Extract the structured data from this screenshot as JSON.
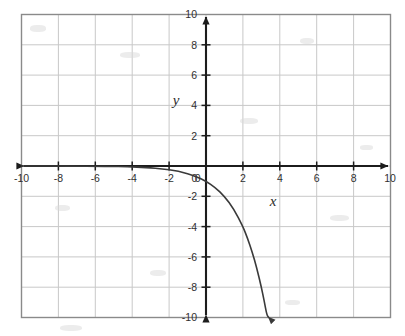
{
  "figure": {
    "name": "coordinate-grid-graph",
    "background_color": "#ffffff",
    "grid_color": "#c8c8c8",
    "border_color": "#8a8a8a",
    "axis_color": "#1c1c1c",
    "curve_color": "#3a3a3a"
  },
  "labels": {
    "x_axis_name": "x",
    "y_axis_name": "y"
  },
  "chart_data": {
    "type": "line",
    "title": "",
    "xlabel": "x",
    "ylabel": "y",
    "xlim": [
      -10,
      10
    ],
    "ylim": [
      -10,
      10
    ],
    "grid": true,
    "grid_step": 2,
    "legend": "none",
    "x_ticks": [
      -10,
      -8,
      -6,
      -4,
      -2,
      0,
      2,
      4,
      6,
      8,
      10
    ],
    "x_tick_labels": [
      "-10",
      "-8",
      "-6",
      "-4",
      "-2",
      "0",
      "2",
      "4",
      "6",
      "8",
      "10"
    ],
    "y_ticks": [
      10,
      8,
      6,
      4,
      2,
      0,
      -2,
      -4,
      -6,
      -8,
      -10
    ],
    "y_tick_labels": [
      "10",
      "8",
      "6",
      "4",
      "2",
      "0",
      "-2",
      "-4",
      "-6",
      "-8",
      "-10"
    ],
    "series": [
      {
        "name": "negative exponential curve",
        "equation": "y = -2^x",
        "arrow_end": "down-right",
        "asymptote": "y = 0",
        "x": [
          -10,
          -9,
          -8,
          -7,
          -6,
          -5,
          -4.5,
          -4,
          -3.5,
          -3,
          -2.5,
          -2,
          -1.5,
          -1,
          -0.5,
          0,
          0.5,
          1,
          1.5,
          2,
          2.25,
          2.5,
          2.75,
          3,
          3.15,
          3.3,
          3.4
        ],
        "values": [
          -0.001,
          -0.002,
          -0.004,
          -0.008,
          -0.016,
          -0.031,
          -0.044,
          -0.063,
          -0.088,
          -0.125,
          -0.177,
          -0.25,
          -0.354,
          -0.5,
          -0.707,
          -1,
          -1.414,
          -2,
          -2.828,
          -4,
          -4.757,
          -5.657,
          -6.727,
          -8,
          -8.875,
          -9.849,
          -10.0
        ]
      }
    ]
  }
}
